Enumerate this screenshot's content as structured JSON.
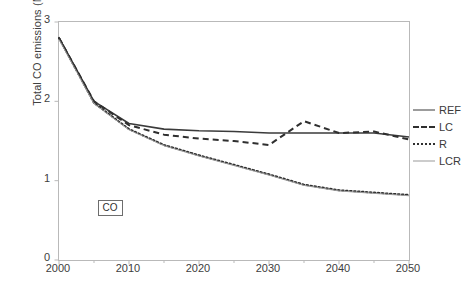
{
  "chart_data": {
    "type": "line",
    "title": "",
    "xlabel": "",
    "ylabel": "Total CO emissions (Mt)",
    "xlim": [
      2000,
      2050
    ],
    "ylim": [
      0,
      3
    ],
    "xticks": [
      2000,
      2010,
      2020,
      2030,
      2040,
      2050
    ],
    "yticks": [
      0,
      1,
      2,
      3
    ],
    "minor_xtick_step": 5,
    "grid": false,
    "legend_position": "right",
    "annotations": [
      {
        "text": "CO",
        "x": 2005.5,
        "y": 0.66,
        "boxed": true
      }
    ],
    "x": [
      2000,
      2005,
      2010,
      2015,
      2020,
      2025,
      2030,
      2035,
      2040,
      2045,
      2050
    ],
    "series": [
      {
        "name": "REF",
        "style": "solid",
        "color": "#3b3b3b",
        "width": 1.6,
        "values": [
          2.8,
          2.0,
          1.72,
          1.65,
          1.63,
          1.62,
          1.6,
          1.6,
          1.6,
          1.6,
          1.55
        ]
      },
      {
        "name": "LC",
        "style": "dashed",
        "color": "#2f2f2f",
        "width": 2.0,
        "values": [
          2.8,
          2.0,
          1.7,
          1.58,
          1.53,
          1.5,
          1.45,
          1.75,
          1.6,
          1.62,
          1.52
        ]
      },
      {
        "name": "R",
        "style": "dotted",
        "color": "#2f2f2f",
        "width": 2.0,
        "values": [
          2.8,
          1.98,
          1.65,
          1.45,
          1.32,
          1.2,
          1.08,
          0.95,
          0.88,
          0.85,
          0.82
        ]
      },
      {
        "name": "LCR",
        "style": "thin",
        "color": "#9a9a9a",
        "width": 1.0,
        "values": [
          2.78,
          1.97,
          1.64,
          1.44,
          1.31,
          1.19,
          1.07,
          0.94,
          0.87,
          0.84,
          0.81
        ]
      }
    ]
  },
  "axis": {
    "y_title": "Total CO emissions (Mt)",
    "y_labels": [
      "3",
      "2",
      "1",
      "0"
    ],
    "x_labels": [
      "2000",
      "2010",
      "2020",
      "2030",
      "2040",
      "2050"
    ]
  },
  "legend": {
    "entries": [
      {
        "label": "REF"
      },
      {
        "label": "LC"
      },
      {
        "label": "R"
      },
      {
        "label": "LCR"
      }
    ]
  }
}
